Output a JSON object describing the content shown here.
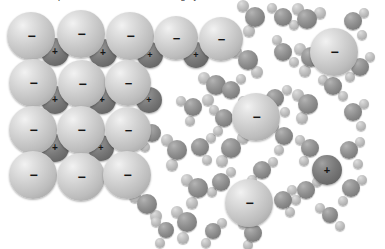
{
  "figure": {
    "clipped_caption_text": "solid in water produces a solution containing hydrated ions",
    "background_color": "#ffffff",
    "width": 385,
    "height": 249
  },
  "legend": {
    "anion_label": "−",
    "cation_label": "+",
    "anion_color": "#cfcfcf",
    "cation_color": "#7a7a7a",
    "oxygen_color": "#8e8e8e",
    "hydrogen_color": "#bcbcbc"
  },
  "crystal": {
    "name": "ionic-crystal-lattice",
    "anions": [
      {
        "cx": 31,
        "cy": 36,
        "r": 24,
        "charge": "−"
      },
      {
        "cx": 81,
        "cy": 34,
        "r": 24,
        "charge": "−"
      },
      {
        "cx": 130,
        "cy": 36,
        "r": 24,
        "charge": "−"
      },
      {
        "cx": 176,
        "cy": 38,
        "r": 22,
        "charge": "−"
      },
      {
        "cx": 221,
        "cy": 39,
        "r": 22,
        "charge": "−"
      },
      {
        "cx": 33,
        "cy": 83,
        "r": 24,
        "charge": "−"
      },
      {
        "cx": 82,
        "cy": 84,
        "r": 24,
        "charge": "−"
      },
      {
        "cx": 128,
        "cy": 83,
        "r": 23,
        "charge": "−"
      },
      {
        "cx": 33,
        "cy": 130,
        "r": 24,
        "charge": "−"
      },
      {
        "cx": 81,
        "cy": 130,
        "r": 24,
        "charge": "−"
      },
      {
        "cx": 128,
        "cy": 130,
        "r": 23,
        "charge": "−"
      },
      {
        "cx": 33,
        "cy": 175,
        "r": 24,
        "charge": "−"
      },
      {
        "cx": 81,
        "cy": 177,
        "r": 24,
        "charge": "−"
      },
      {
        "cx": 127,
        "cy": 175,
        "r": 24,
        "charge": "−"
      }
    ],
    "cations": [
      {
        "cx": 55,
        "cy": 52,
        "r": 14,
        "charge": "+"
      },
      {
        "cx": 103,
        "cy": 53,
        "r": 14,
        "charge": "+"
      },
      {
        "cx": 150,
        "cy": 55,
        "r": 13,
        "charge": "+"
      },
      {
        "cx": 196,
        "cy": 55,
        "r": 13,
        "charge": "+"
      },
      {
        "cx": 55,
        "cy": 100,
        "r": 14,
        "charge": "+"
      },
      {
        "cx": 102,
        "cy": 100,
        "r": 14,
        "charge": "+"
      },
      {
        "cx": 149,
        "cy": 100,
        "r": 13,
        "charge": "+"
      },
      {
        "cx": 55,
        "cy": 148,
        "r": 14,
        "charge": "+"
      },
      {
        "cx": 101,
        "cy": 148,
        "r": 13,
        "charge": "+"
      }
    ]
  },
  "solvated_ions": [
    {
      "name": "solvated-anion-top-right",
      "cx": 334,
      "cy": 52,
      "r": 24,
      "charge": "−"
    },
    {
      "name": "solvated-anion-center",
      "cx": 256,
      "cy": 117,
      "r": 24,
      "charge": "−"
    },
    {
      "name": "solvated-anion-bottom",
      "cx": 249,
      "cy": 203,
      "r": 24,
      "charge": "−"
    },
    {
      "name": "solvated-cation-right",
      "cx": 327,
      "cy": 170,
      "r": 15,
      "charge": "+"
    }
  ],
  "water_molecules": [
    {
      "ox": 255,
      "oy": 17,
      "orad": 10,
      "h": [
        {
          "x": 243,
          "y": 6,
          "r": 6
        },
        {
          "x": 249,
          "y": 31,
          "r": 6
        }
      ]
    },
    {
      "ox": 283,
      "oy": 17,
      "orad": 9,
      "h": [
        {
          "x": 272,
          "y": 8,
          "r": 5
        },
        {
          "x": 294,
          "y": 25,
          "r": 5
        }
      ]
    },
    {
      "ox": 248,
      "oy": 60,
      "orad": 10,
      "h": [
        {
          "x": 236,
          "y": 52,
          "r": 6
        },
        {
          "x": 257,
          "y": 72,
          "r": 6
        }
      ]
    },
    {
      "ox": 283,
      "oy": 52,
      "orad": 9,
      "h": [
        {
          "x": 277,
          "y": 40,
          "r": 5
        },
        {
          "x": 294,
          "y": 62,
          "r": 5
        }
      ]
    },
    {
      "ox": 216,
      "oy": 85,
      "orad": 10,
      "h": [
        {
          "x": 204,
          "y": 78,
          "r": 6
        },
        {
          "x": 208,
          "y": 100,
          "r": 6
        }
      ]
    },
    {
      "ox": 193,
      "oy": 107,
      "orad": 9,
      "h": [
        {
          "x": 181,
          "y": 101,
          "r": 5
        },
        {
          "x": 190,
          "y": 121,
          "r": 5
        }
      ]
    },
    {
      "ox": 231,
      "oy": 90,
      "orad": 9,
      "h": [
        {
          "x": 241,
          "y": 79,
          "r": 5
        },
        {
          "x": 243,
          "y": 101,
          "r": 5
        }
      ]
    },
    {
      "ox": 152,
      "oy": 133,
      "orad": 9,
      "h": [
        {
          "x": 141,
          "y": 125,
          "r": 5
        },
        {
          "x": 145,
          "y": 147,
          "r": 5
        }
      ]
    },
    {
      "ox": 177,
      "oy": 150,
      "orad": 10,
      "h": [
        {
          "x": 167,
          "y": 140,
          "r": 6
        },
        {
          "x": 172,
          "y": 165,
          "r": 6
        }
      ]
    },
    {
      "ox": 200,
      "oy": 147,
      "orad": 9,
      "h": [
        {
          "x": 211,
          "y": 138,
          "r": 5
        },
        {
          "x": 207,
          "y": 160,
          "r": 5
        }
      ]
    },
    {
      "ox": 231,
      "oy": 148,
      "orad": 10,
      "h": [
        {
          "x": 222,
          "y": 161,
          "r": 6
        },
        {
          "x": 243,
          "y": 138,
          "r": 6
        }
      ]
    },
    {
      "ox": 198,
      "oy": 188,
      "orad": 10,
      "h": [
        {
          "x": 187,
          "y": 180,
          "r": 6
        },
        {
          "x": 192,
          "y": 203,
          "r": 6
        }
      ]
    },
    {
      "ox": 147,
      "oy": 204,
      "orad": 10,
      "h": [
        {
          "x": 135,
          "y": 197,
          "r": 6
        },
        {
          "x": 156,
          "y": 216,
          "r": 6
        }
      ]
    },
    {
      "ox": 187,
      "oy": 222,
      "orad": 10,
      "h": [
        {
          "x": 177,
          "y": 212,
          "r": 6
        },
        {
          "x": 183,
          "y": 238,
          "r": 6
        }
      ]
    },
    {
      "ox": 275,
      "oy": 98,
      "orad": 9,
      "h": [
        {
          "x": 287,
          "y": 90,
          "r": 5
        },
        {
          "x": 285,
          "y": 112,
          "r": 5
        }
      ]
    },
    {
      "ox": 284,
      "oy": 136,
      "orad": 9,
      "h": [
        {
          "x": 274,
          "y": 127,
          "r": 5
        },
        {
          "x": 279,
          "y": 150,
          "r": 5
        }
      ]
    },
    {
      "ox": 224,
      "oy": 118,
      "orad": 9,
      "h": [
        {
          "x": 214,
          "y": 110,
          "r": 5
        },
        {
          "x": 218,
          "y": 131,
          "r": 5
        }
      ]
    },
    {
      "ox": 262,
      "oy": 170,
      "orad": 9,
      "h": [
        {
          "x": 273,
          "y": 162,
          "r": 5
        },
        {
          "x": 252,
          "y": 180,
          "r": 5
        }
      ]
    },
    {
      "ox": 221,
      "oy": 182,
      "orad": 9,
      "h": [
        {
          "x": 231,
          "y": 172,
          "r": 5
        },
        {
          "x": 212,
          "y": 192,
          "r": 5
        }
      ]
    },
    {
      "ox": 283,
      "oy": 200,
      "orad": 9,
      "h": [
        {
          "x": 292,
          "y": 190,
          "r": 5
        },
        {
          "x": 290,
          "y": 212,
          "r": 5
        }
      ]
    },
    {
      "ox": 253,
      "oy": 233,
      "orad": 9,
      "h": [
        {
          "x": 243,
          "y": 224,
          "r": 5
        },
        {
          "x": 248,
          "y": 245,
          "r": 5
        }
      ]
    },
    {
      "ox": 307,
      "oy": 19,
      "orad": 10,
      "h": [
        {
          "x": 298,
          "y": 9,
          "r": 6
        },
        {
          "x": 320,
          "y": 13,
          "r": 6
        }
      ]
    },
    {
      "ox": 311,
      "oy": 57,
      "orad": 10,
      "h": [
        {
          "x": 300,
          "y": 49,
          "r": 6
        },
        {
          "x": 305,
          "y": 71,
          "r": 6
        }
      ]
    },
    {
      "ox": 353,
      "oy": 21,
      "orad": 9,
      "h": [
        {
          "x": 364,
          "y": 13,
          "r": 5
        },
        {
          "x": 362,
          "y": 35,
          "r": 5
        }
      ]
    },
    {
      "ox": 360,
      "oy": 67,
      "orad": 9,
      "h": [
        {
          "x": 370,
          "y": 57,
          "r": 5
        },
        {
          "x": 350,
          "y": 77,
          "r": 5
        }
      ]
    },
    {
      "ox": 333,
      "oy": 86,
      "orad": 9,
      "h": [
        {
          "x": 323,
          "y": 80,
          "r": 5
        },
        {
          "x": 343,
          "y": 96,
          "r": 5
        }
      ]
    },
    {
      "ox": 308,
      "oy": 104,
      "orad": 10,
      "h": [
        {
          "x": 298,
          "y": 95,
          "r": 6
        },
        {
          "x": 302,
          "y": 118,
          "r": 6
        }
      ]
    },
    {
      "ox": 353,
      "oy": 112,
      "orad": 9,
      "h": [
        {
          "x": 364,
          "y": 104,
          "r": 5
        },
        {
          "x": 361,
          "y": 126,
          "r": 5
        }
      ]
    },
    {
      "ox": 310,
      "oy": 148,
      "orad": 9,
      "h": [
        {
          "x": 300,
          "y": 140,
          "r": 5
        },
        {
          "x": 304,
          "y": 161,
          "r": 5
        }
      ]
    },
    {
      "ox": 349,
      "oy": 150,
      "orad": 9,
      "h": [
        {
          "x": 360,
          "y": 142,
          "r": 5
        },
        {
          "x": 358,
          "y": 164,
          "r": 5
        }
      ]
    },
    {
      "ox": 306,
      "oy": 190,
      "orad": 9,
      "h": [
        {
          "x": 317,
          "y": 182,
          "r": 5
        },
        {
          "x": 296,
          "y": 200,
          "r": 5
        }
      ]
    },
    {
      "ox": 351,
      "oy": 188,
      "orad": 9,
      "h": [
        {
          "x": 362,
          "y": 180,
          "r": 5
        },
        {
          "x": 343,
          "y": 201,
          "r": 5
        }
      ]
    },
    {
      "ox": 330,
      "oy": 215,
      "orad": 8,
      "h": [
        {
          "x": 320,
          "y": 208,
          "r": 5
        },
        {
          "x": 340,
          "y": 226,
          "r": 5
        }
      ]
    },
    {
      "ox": 166,
      "oy": 230,
      "orad": 8,
      "h": [
        {
          "x": 156,
          "y": 222,
          "r": 5
        },
        {
          "x": 160,
          "y": 243,
          "r": 5
        }
      ]
    },
    {
      "ox": 213,
      "oy": 231,
      "orad": 8,
      "h": [
        {
          "x": 222,
          "y": 223,
          "r": 5
        },
        {
          "x": 206,
          "y": 243,
          "r": 5
        }
      ]
    }
  ],
  "solvation_shells": [
    {
      "around": "solvated-anion-top-right",
      "waters": [
        {
          "ox": 307,
          "oy": 19,
          "orad": 10,
          "h": [
            {
              "x": 298,
              "y": 9,
              "r": 6
            },
            {
              "x": 320,
              "y": 13,
              "r": 6
            }
          ]
        },
        {
          "ox": 353,
          "oy": 21,
          "orad": 9,
          "h": [
            {
              "x": 364,
              "y": 13,
              "r": 5
            },
            {
              "x": 362,
              "y": 35,
              "r": 5
            }
          ]
        },
        {
          "ox": 311,
          "oy": 57,
          "orad": 10,
          "h": [
            {
              "x": 300,
              "y": 49,
              "r": 6
            },
            {
              "x": 305,
              "y": 71,
              "r": 6
            }
          ]
        },
        {
          "ox": 360,
          "oy": 67,
          "orad": 9,
          "h": [
            {
              "x": 370,
              "y": 57,
              "r": 5
            },
            {
              "x": 350,
              "y": 77,
              "r": 5
            }
          ]
        }
      ]
    },
    {
      "around": "solvated-anion-center",
      "waters": [
        {
          "ox": 224,
          "oy": 118,
          "orad": 9,
          "h": [
            {
              "x": 214,
              "y": 110,
              "r": 5
            },
            {
              "x": 218,
              "y": 131,
              "r": 5
            }
          ]
        },
        {
          "ox": 275,
          "oy": 98,
          "orad": 9,
          "h": [
            {
              "x": 287,
              "y": 90,
              "r": 5
            },
            {
              "x": 285,
              "y": 112,
              "r": 5
            }
          ]
        },
        {
          "ox": 284,
          "oy": 136,
          "orad": 9,
          "h": [
            {
              "x": 274,
              "y": 127,
              "r": 5
            },
            {
              "x": 279,
              "y": 150,
              "r": 5
            }
          ]
        },
        {
          "ox": 231,
          "oy": 148,
          "orad": 10,
          "h": [
            {
              "x": 222,
              "y": 161,
              "r": 6
            },
            {
              "x": 243,
              "y": 138,
              "r": 6
            }
          ]
        }
      ]
    },
    {
      "around": "solvated-anion-bottom",
      "waters": [
        {
          "ox": 221,
          "oy": 182,
          "orad": 9,
          "h": [
            {
              "x": 231,
              "y": 172,
              "r": 5
            },
            {
              "x": 212,
              "y": 192,
              "r": 5
            }
          ]
        },
        {
          "ox": 283,
          "oy": 200,
          "orad": 9,
          "h": [
            {
              "x": 292,
              "y": 190,
              "r": 5
            },
            {
              "x": 290,
              "y": 212,
              "r": 5
            }
          ]
        },
        {
          "ox": 253,
          "oy": 233,
          "orad": 9,
          "h": [
            {
              "x": 243,
              "y": 224,
              "r": 5
            },
            {
              "x": 248,
              "y": 245,
              "r": 5
            }
          ]
        },
        {
          "ox": 213,
          "oy": 231,
          "orad": 8,
          "h": [
            {
              "x": 222,
              "y": 223,
              "r": 5
            },
            {
              "x": 206,
              "y": 243,
              "r": 5
            }
          ]
        }
      ]
    },
    {
      "around": "solvated-cation-right",
      "waters": [
        {
          "ox": 310,
          "oy": 148,
          "orad": 9,
          "h": [
            {
              "x": 300,
              "y": 140,
              "r": 5
            },
            {
              "x": 304,
              "y": 161,
              "r": 5
            }
          ]
        },
        {
          "ox": 349,
          "oy": 150,
          "orad": 9,
          "h": [
            {
              "x": 360,
              "y": 142,
              "r": 5
            },
            {
              "x": 358,
              "y": 164,
              "r": 5
            }
          ]
        },
        {
          "ox": 306,
          "oy": 190,
          "orad": 9,
          "h": [
            {
              "x": 317,
              "y": 182,
              "r": 5
            },
            {
              "x": 296,
              "y": 200,
              "r": 5
            }
          ]
        },
        {
          "ox": 351,
          "oy": 188,
          "orad": 9,
          "h": [
            {
              "x": 362,
              "y": 180,
              "r": 5
            },
            {
              "x": 343,
              "y": 201,
              "r": 5
            }
          ]
        }
      ]
    }
  ]
}
